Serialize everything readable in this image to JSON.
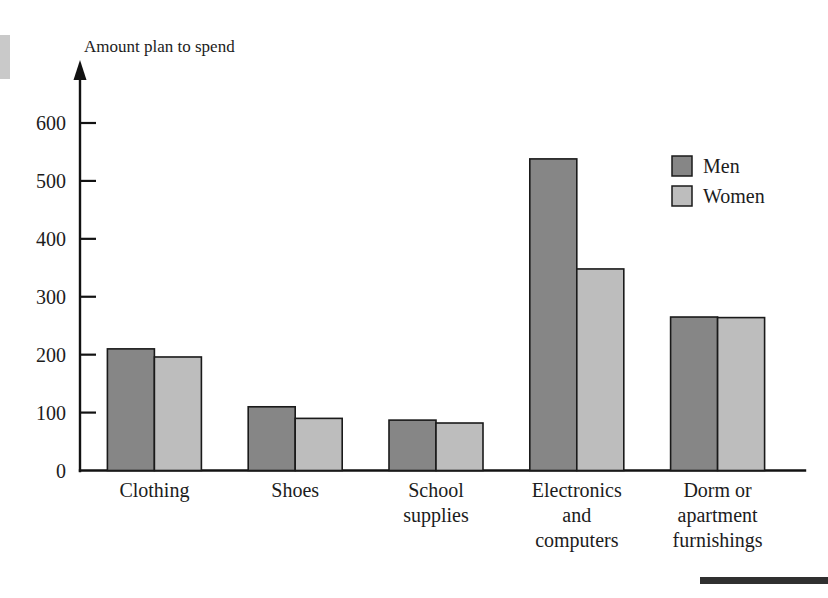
{
  "figure": {
    "background_color": "#ffffff",
    "axis_color": "#121212",
    "text_color": "#1c1c1c"
  },
  "chart_data": {
    "type": "bar",
    "title": "Amount plan to spend",
    "subtitle": "",
    "xlabel": "",
    "ylabel": "Amount plan to spend",
    "categories": [
      "Clothing",
      "Shoes",
      "School supplies",
      "Electronics and computers",
      "Dorm or apartment furnishings"
    ],
    "category_label_lines": [
      [
        "Clothing"
      ],
      [
        "Shoes"
      ],
      [
        "School",
        "supplies"
      ],
      [
        "Electronics",
        "and",
        "computers"
      ],
      [
        "Dorm or",
        "apartment",
        "furnishings"
      ]
    ],
    "series": [
      {
        "name": "Men",
        "color": "#868686",
        "values": [
          210,
          110,
          87,
          538,
          265
        ]
      },
      {
        "name": "Women",
        "color": "#bdbdbd",
        "values": [
          196,
          90,
          82,
          348,
          264
        ]
      }
    ],
    "ylim": [
      0,
      650
    ],
    "yticks": [
      0,
      100,
      200,
      300,
      400,
      500,
      600
    ],
    "ytick_labels": [
      "0",
      "100",
      "200",
      "300",
      "400",
      "500",
      "600"
    ],
    "grid": false,
    "legend_position": "top-right",
    "legend_entries": [
      {
        "label": "Men",
        "color": "#868686"
      },
      {
        "label": "Women",
        "color": "#bdbdbd"
      }
    ]
  },
  "decorations": {
    "left_edge_artifact": true,
    "bottom_rule": true
  }
}
